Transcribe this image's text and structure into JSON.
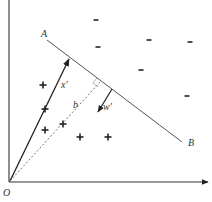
{
  "diagram": {
    "type": "svm-geometry",
    "labels": {
      "origin": "O",
      "line_start": "A",
      "line_end": "B",
      "vector_x": "x′",
      "vector_w": "w′",
      "offset": "b"
    },
    "plus_symbol": "+",
    "minus_symbol": "-",
    "plus_points": [
      [
        43,
        85
      ],
      [
        45,
        109
      ],
      [
        45,
        130
      ],
      [
        63,
        124
      ],
      [
        80,
        137
      ],
      [
        108,
        137
      ]
    ],
    "minus_points": [
      [
        96,
        20
      ],
      [
        98,
        47
      ],
      [
        149,
        40
      ],
      [
        190,
        42
      ],
      [
        141,
        70
      ],
      [
        187,
        96
      ]
    ],
    "colors": {
      "axis": "#222222",
      "line": "#444444",
      "text": "#333333"
    }
  }
}
